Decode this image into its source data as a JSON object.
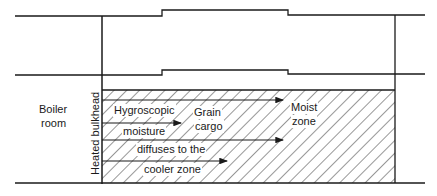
{
  "diagram": {
    "type": "cross-section",
    "labels": {
      "boiler_room_line1": "Boiler",
      "boiler_room_line2": "room",
      "heated_bulkhead": "Heated bulkhead",
      "hygroscopic": "Hygroscopic",
      "moisture": "moisture",
      "diffuses": "diffuses to the",
      "cooler": "cooler zone",
      "grain": "Grain",
      "cargo": "cargo",
      "moist": "Moist",
      "zone": "zone"
    },
    "colors": {
      "line": "#1a1a1a",
      "background": "#ffffff"
    },
    "arrows": [
      {
        "y": 100,
        "x_end": 283
      },
      {
        "y": 123,
        "x_end": 181
      },
      {
        "y": 140,
        "x_end": 283
      },
      {
        "y": 161,
        "x_end": 227
      }
    ]
  }
}
